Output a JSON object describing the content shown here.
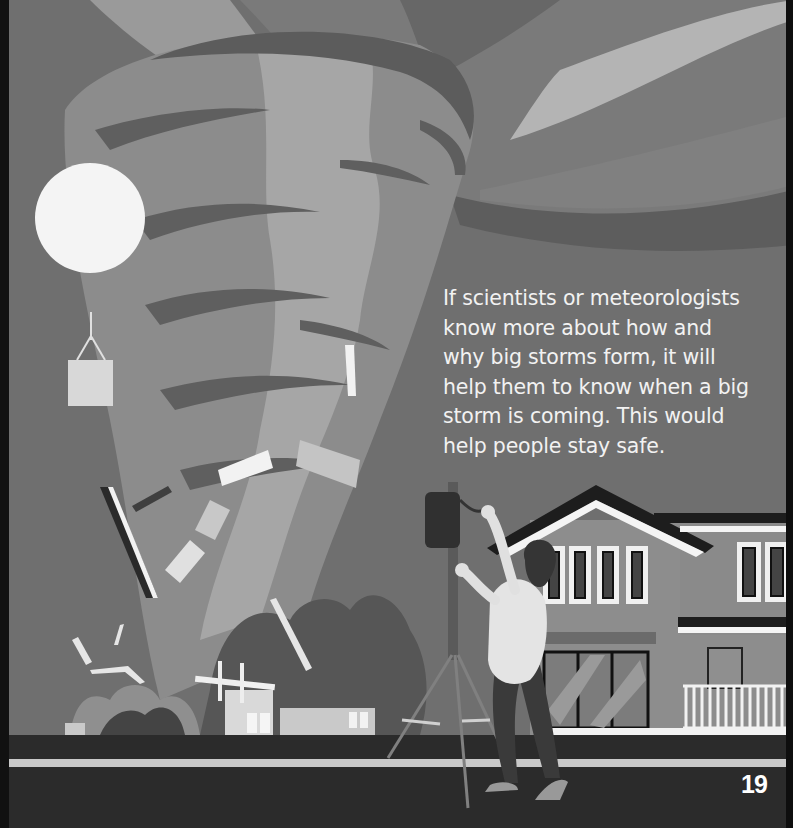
{
  "page": {
    "body_text": "If scientists or meteorologists\nknow more about how and\nwhy big storms form, it will\nhelp them to know when a big\nstorm is coming. This would\nhelp people stay safe.",
    "page_number": "19"
  },
  "illustration": {
    "description": "Grayscale illustration of a tornado destroying buildings, a weather balloon with an instrument box, and a person adjusting a weather station on a tripod in front of a two-story house beside a road",
    "elements": [
      "tornado",
      "weather-balloon",
      "instrument-box",
      "flying-debris",
      "destroyed-building",
      "weather-station-tripod",
      "person",
      "house",
      "road"
    ]
  },
  "colors": {
    "sky": "#6f6f6f",
    "tornado_light": "#a3a3a3",
    "tornado_mid": "#8a8a8a",
    "tornado_dark": "#5e5e5e",
    "balloon": "#f4f4f4",
    "road": "#2b2b2b",
    "road_stripe": "#c9c9c9",
    "text": "#f2f2f2"
  }
}
